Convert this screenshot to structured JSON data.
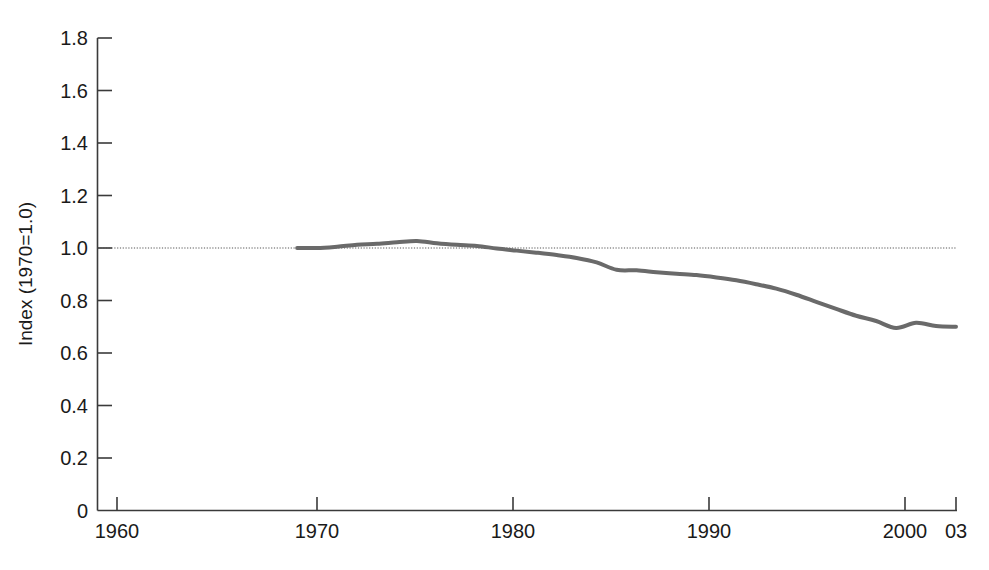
{
  "chart_data": {
    "type": "line",
    "title": "",
    "subtitle": "",
    "xlabel": "",
    "ylabel": "Index (1970=1.0)",
    "xlim": [
      1960,
      2003
    ],
    "ylim": [
      0,
      1.8
    ],
    "grid": false,
    "legend": null,
    "legend_position": "none",
    "background_color": "#ffffff",
    "line_color": "#6a6a6a",
    "line_width_px": 4,
    "axis_color": "#3a3a3a",
    "text_color": "#1a1a1a",
    "y_ticks": [
      0,
      0.2,
      0.4,
      0.6,
      0.8,
      1.0,
      1.2,
      1.4,
      1.6,
      1.8
    ],
    "y_tick_labels": [
      "0",
      "0.2",
      "0.4",
      "0.6",
      "0.8",
      "1.0",
      "1.2",
      "1.4",
      "1.6",
      "1.8"
    ],
    "x_ticks": [
      1960,
      1970,
      1980,
      1990,
      2000,
      2003
    ],
    "x_tick_labels": [
      "1960",
      "1970",
      "1980",
      "1990",
      "2000",
      "03"
    ],
    "reference_lines": [
      {
        "name": "baseline-1970",
        "orientation": "horizontal",
        "value": 1.0,
        "style": "dotted",
        "color": "#555555"
      }
    ],
    "annotations": [],
    "series": [
      {
        "name": "Index",
        "color": "#6a6a6a",
        "x": [
          1970,
          1971,
          1972,
          1973,
          1974,
          1975,
          1976,
          1977,
          1978,
          1979,
          1980,
          1981,
          1982,
          1983,
          1984,
          1985,
          1986,
          1987,
          1988,
          1989,
          1990,
          1991,
          1992,
          1993,
          1994,
          1995,
          1996,
          1997,
          1998,
          1999,
          2000,
          2001,
          2002,
          2003
        ],
        "values": [
          1.0,
          1.0,
          1.005,
          1.012,
          1.016,
          1.022,
          1.027,
          1.018,
          1.012,
          1.008,
          0.998,
          0.99,
          0.982,
          0.973,
          0.962,
          0.945,
          0.917,
          0.915,
          0.908,
          0.902,
          0.897,
          0.888,
          0.877,
          0.862,
          0.845,
          0.822,
          0.795,
          0.768,
          0.742,
          0.722,
          0.695,
          0.715,
          0.703,
          0.7
        ]
      }
    ]
  }
}
